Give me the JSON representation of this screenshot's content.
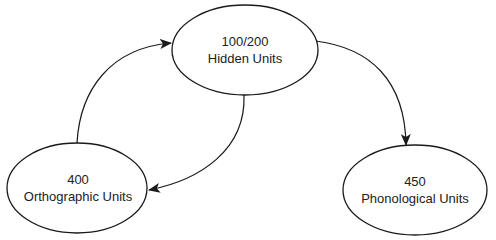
{
  "diagram": {
    "background": "#ffffff",
    "stroke_color": "#1a1a1a",
    "nodes": [
      {
        "id": "hidden",
        "count": "100/200",
        "label": "Hidden Units",
        "cx": 245,
        "cy": 50,
        "rx": 73,
        "ry": 45
      },
      {
        "id": "orthographic",
        "count": "400",
        "label": "Orthographic Units",
        "cx": 77,
        "cy": 188,
        "rx": 70,
        "ry": 45
      },
      {
        "id": "phonological",
        "count": "450",
        "label": "Phonological Units",
        "cx": 415,
        "cy": 190,
        "rx": 72,
        "ry": 45
      }
    ],
    "edges": [
      {
        "from": "orthographic",
        "to": "hidden"
      },
      {
        "from": "hidden",
        "to": "phonological"
      },
      {
        "from": "hidden",
        "to": "orthographic"
      }
    ]
  }
}
